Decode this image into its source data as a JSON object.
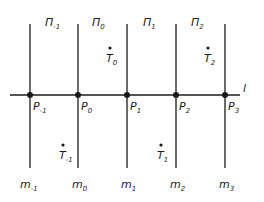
{
  "diagram": {
    "line_l": {
      "label": "l"
    },
    "planes": [
      {
        "base": "Π",
        "sub": "-1"
      },
      {
        "base": "Π",
        "sub": "0"
      },
      {
        "base": "Π",
        "sub": "1"
      },
      {
        "base": "Π",
        "sub": "2"
      }
    ],
    "intersection_points": [
      {
        "base": "P",
        "sub": "-1"
      },
      {
        "base": "P",
        "sub": "0"
      },
      {
        "base": "P",
        "sub": "1"
      },
      {
        "base": "P",
        "sub": "2"
      },
      {
        "base": "P",
        "sub": "3"
      }
    ],
    "vertical_lines": [
      {
        "base": "m",
        "sub": "-1"
      },
      {
        "base": "m",
        "sub": "0"
      },
      {
        "base": "m",
        "sub": "1"
      },
      {
        "base": "m",
        "sub": "2"
      },
      {
        "base": "m",
        "sub": "3"
      }
    ],
    "free_points": [
      {
        "base": "T",
        "sub": "0"
      },
      {
        "base": "T",
        "sub": "2"
      },
      {
        "base": "T",
        "sub": "-1"
      },
      {
        "base": "T",
        "sub": "1"
      }
    ],
    "colors": {
      "ink": "#1a1a1a",
      "background": "#ffffff"
    }
  }
}
